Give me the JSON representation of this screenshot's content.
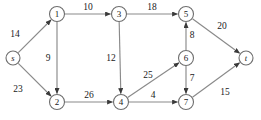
{
  "figure": {
    "background_color": "#ffffff",
    "edge_color": "#8a8a8a",
    "node_stroke_color": "#6e6e6e",
    "node_fill_color": "#ffffff",
    "text_color": "#1a1a1a",
    "width": 261,
    "height": 120
  },
  "chart_data": {
    "type": "diagram",
    "title": "",
    "directed": true,
    "weighted": true,
    "nodes": [
      {
        "id": "s",
        "label": "s",
        "x": 13,
        "y": 58,
        "r": 7,
        "italic": true
      },
      {
        "id": "1",
        "label": "1",
        "x": 57,
        "y": 14,
        "r": 7.5,
        "italic": false
      },
      {
        "id": "2",
        "label": "2",
        "x": 57,
        "y": 102,
        "r": 7.5,
        "italic": false
      },
      {
        "id": "3",
        "label": "3",
        "x": 119,
        "y": 14,
        "r": 7.5,
        "italic": false
      },
      {
        "id": "4",
        "label": "4",
        "x": 121,
        "y": 102,
        "r": 7.5,
        "italic": false
      },
      {
        "id": "5",
        "label": "5",
        "x": 186,
        "y": 14,
        "r": 7.5,
        "italic": false
      },
      {
        "id": "6",
        "label": "6",
        "x": 186,
        "y": 58,
        "r": 7.5,
        "italic": false
      },
      {
        "id": "7",
        "label": "7",
        "x": 186,
        "y": 102,
        "r": 7.5,
        "italic": false
      },
      {
        "id": "t",
        "label": "t",
        "x": 246,
        "y": 58,
        "r": 7,
        "italic": true
      }
    ],
    "edges": [
      {
        "from": "s",
        "to": "1",
        "weight": 14,
        "label_x": 15,
        "label_y": 34
      },
      {
        "from": "s",
        "to": "2",
        "weight": 23,
        "label_x": 18,
        "label_y": 89
      },
      {
        "from": "1",
        "to": "3",
        "weight": 10,
        "label_x": 88,
        "label_y": 7
      },
      {
        "from": "1",
        "to": "2",
        "weight": 9,
        "label_x": 48,
        "label_y": 58
      },
      {
        "from": "3",
        "to": "5",
        "weight": 18,
        "label_x": 152,
        "label_y": 7
      },
      {
        "from": "3",
        "to": "4",
        "weight": 12,
        "label_x": 111,
        "label_y": 58
      },
      {
        "from": "2",
        "to": "4",
        "weight": 26,
        "label_x": 89,
        "label_y": 95
      },
      {
        "from": "4",
        "to": "6",
        "weight": 25,
        "label_x": 148,
        "label_y": 75
      },
      {
        "from": "4",
        "to": "7",
        "weight": 4,
        "label_x": 153,
        "label_y": 95
      },
      {
        "from": "6",
        "to": "5",
        "weight": 8,
        "label_x": 192,
        "label_y": 35
      },
      {
        "from": "6",
        "to": "7",
        "weight": 7,
        "label_x": 192,
        "label_y": 78
      },
      {
        "from": "5",
        "to": "t",
        "weight": 20,
        "label_x": 222,
        "label_y": 26
      },
      {
        "from": "7",
        "to": "t",
        "weight": 15,
        "label_x": 225,
        "label_y": 92
      }
    ]
  }
}
